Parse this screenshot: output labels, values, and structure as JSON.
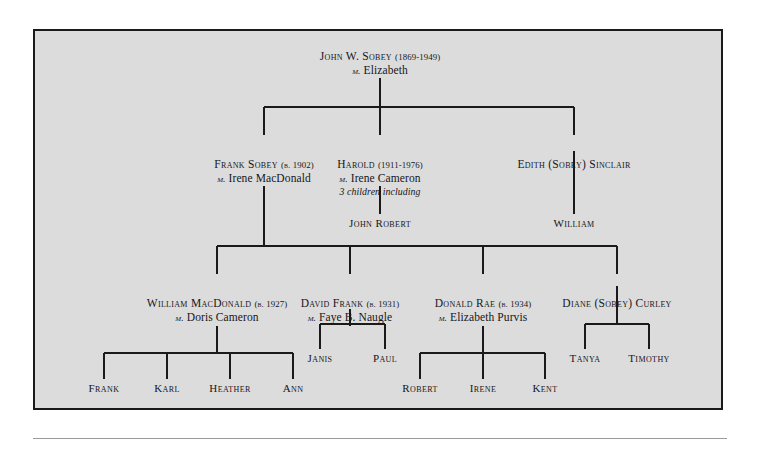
{
  "diagram": {
    "type": "family-tree",
    "title_text": "",
    "colors": {
      "panel_background": "#dcdcdc",
      "page_background": "#ffffff",
      "border": "#1a1a1a",
      "line": "#1a1a1a",
      "text": "#16161a",
      "rule": "#9a9a9a"
    },
    "generations": [
      {
        "level": 1,
        "people": [
          {
            "id": "john_w_sobey",
            "name": "John W. Sobey",
            "years": "(1869-1949)",
            "marriage_prefix": "m.",
            "spouse": "Elizabeth",
            "note": ""
          }
        ]
      },
      {
        "level": 2,
        "people": [
          {
            "id": "frank_sobey",
            "name": "Frank Sobey",
            "years": "(b. 1902)",
            "marriage_prefix": "m.",
            "spouse": "Irene MacDonald",
            "note": ""
          },
          {
            "id": "harold",
            "name": "Harold",
            "years": "(1911-1976)",
            "marriage_prefix": "m.",
            "spouse": "Irene Cameron",
            "note": "3 children including"
          },
          {
            "id": "edith_sobey_sinclair",
            "name": "Edith (Sobey) Sinclair",
            "years": "",
            "marriage_prefix": "",
            "spouse": "",
            "note": ""
          }
        ]
      },
      {
        "level": 3,
        "people": [
          {
            "id": "john_robert",
            "name": "John Robert",
            "years": "",
            "marriage_prefix": "",
            "spouse": "",
            "note": ""
          },
          {
            "id": "william",
            "name": "William",
            "years": "",
            "marriage_prefix": "",
            "spouse": "",
            "note": ""
          },
          {
            "id": "william_macdonald",
            "name": "William MacDonald",
            "years": "(b. 1927)",
            "marriage_prefix": "m.",
            "spouse": "Doris Cameron",
            "note": ""
          },
          {
            "id": "david_frank",
            "name": "David Frank",
            "years": "(b. 1931)",
            "marriage_prefix": "m.",
            "spouse": "Faye B. Naugle",
            "note": ""
          },
          {
            "id": "donald_rae",
            "name": "Donald Rae",
            "years": "(b. 1934)",
            "marriage_prefix": "m.",
            "spouse": "Elizabeth Purvis",
            "note": ""
          },
          {
            "id": "diane_sobey_curley",
            "name": "Diane (Sobey) Curley",
            "years": "",
            "marriage_prefix": "",
            "spouse": "",
            "note": ""
          }
        ]
      },
      {
        "level": 4,
        "people": [
          {
            "id": "frank",
            "name": "Frank"
          },
          {
            "id": "karl",
            "name": "Karl"
          },
          {
            "id": "heather",
            "name": "Heather"
          },
          {
            "id": "ann",
            "name": "Ann"
          },
          {
            "id": "janis",
            "name": "Janis"
          },
          {
            "id": "paul",
            "name": "Paul"
          },
          {
            "id": "robert",
            "name": "Robert"
          },
          {
            "id": "irene",
            "name": "Irene"
          },
          {
            "id": "kent",
            "name": "Kent"
          },
          {
            "id": "tanya",
            "name": "Tanya"
          },
          {
            "id": "timothy",
            "name": "Timothy"
          }
        ]
      }
    ],
    "nodes": {
      "john_w_sobey": {
        "name": "John W. Sobey",
        "years": "(1869-1949)",
        "mm": "m.",
        "spouse": "Elizabeth"
      },
      "frank_sobey": {
        "name": "Frank Sobey",
        "years": "(b. 1902)",
        "mm": "m.",
        "spouse": "Irene MacDonald"
      },
      "harold": {
        "name": "Harold",
        "years": "(1911-1976)",
        "mm": "m.",
        "spouse": "Irene Cameron",
        "note": "3 children including"
      },
      "edith": {
        "name": "Edith (Sobey) Sinclair"
      },
      "john_robert": {
        "name": "John Robert"
      },
      "william": {
        "name": "William"
      },
      "william_macdonald": {
        "name": "William MacDonald",
        "years": "(b. 1927)",
        "mm": "m.",
        "spouse": "Doris Cameron"
      },
      "david_frank": {
        "name": "David Frank",
        "years": "(b. 1931)",
        "mm": "m.",
        "spouse": "Faye B. Naugle"
      },
      "donald_rae": {
        "name": "Donald Rae",
        "years": "(b. 1934)",
        "mm": "m.",
        "spouse": "Elizabeth Purvis"
      },
      "diane": {
        "name": "Diane (Sobey) Curley"
      },
      "frank": {
        "name": "Frank"
      },
      "karl": {
        "name": "Karl"
      },
      "heather": {
        "name": "Heather"
      },
      "ann": {
        "name": "Ann"
      },
      "janis": {
        "name": "Janis"
      },
      "paul": {
        "name": "Paul"
      },
      "robert": {
        "name": "Robert"
      },
      "irene": {
        "name": "Irene"
      },
      "kent": {
        "name": "Kent"
      },
      "tanya": {
        "name": "Tanya"
      },
      "timothy": {
        "name": "Timothy"
      }
    }
  }
}
